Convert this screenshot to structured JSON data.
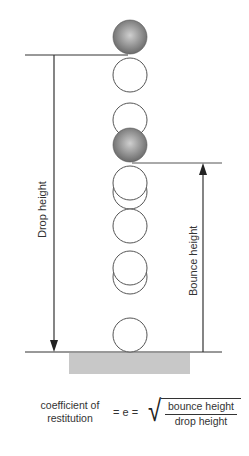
{
  "diagram": {
    "labels": {
      "drop_height": "Drop height",
      "bounce_height": "Bounce height"
    },
    "formula": {
      "lhs_line1": "coefficient of",
      "lhs_line2": "restitution",
      "equals": "= e =",
      "sqrt_symbol": "√",
      "numerator": "bounce height",
      "denominator": "drop height"
    },
    "colors": {
      "line": "#333333",
      "ball_fill_center": "#c8c8c8",
      "ball_fill_edge": "#6e6e6e",
      "empty_ball_stroke": "#555555",
      "ground_slab": "#c8c8c8"
    }
  }
}
